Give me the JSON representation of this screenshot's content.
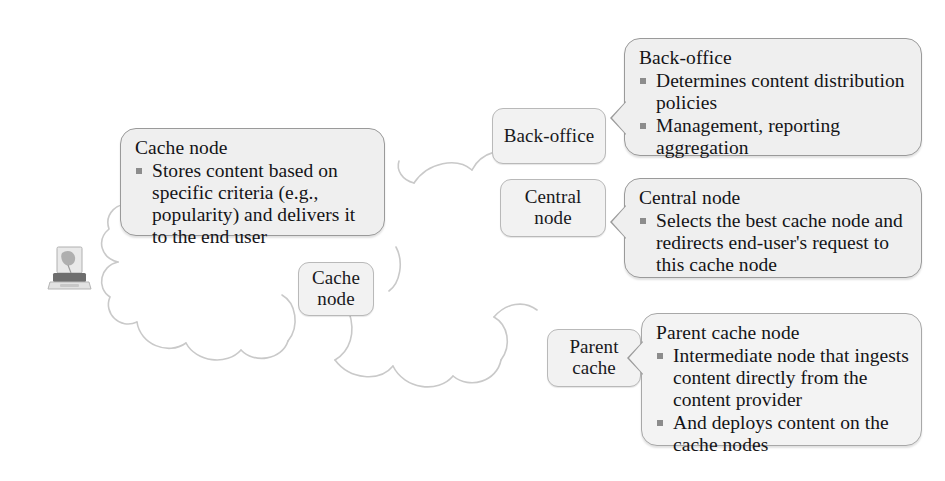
{
  "diagram": {
    "background_color": "#ffffff",
    "box_fill": "#efefef",
    "box_border": "#9a9a9a",
    "chip_fill": "#f2f2f2",
    "bullet_color": "#8c8c8c",
    "cloud_stroke": "#c9c9c9"
  },
  "clipart": {
    "laptop_label": "end-user-laptop"
  },
  "chips": [
    {
      "id": "cache-node",
      "label_line1": "Cache",
      "label_line2": "node"
    },
    {
      "id": "back-office",
      "label_line1": "Back-office",
      "label_line2": ""
    },
    {
      "id": "central-node",
      "label_line1": "Central",
      "label_line2": "node"
    },
    {
      "id": "parent-cache",
      "label_line1": "Parent",
      "label_line2": "cache"
    }
  ],
  "callouts": [
    {
      "id": "cache-node-callout",
      "title": "Cache node",
      "bullets": [
        "Stores content based on specific criteria (e.g., popularity) and delivers it to the end user"
      ]
    },
    {
      "id": "back-office-callout",
      "title": "Back-office",
      "bullets": [
        "Determines content distribution policies",
        "Management, reporting aggregation"
      ]
    },
    {
      "id": "central-node-callout",
      "title": "Central node",
      "bullets": [
        "Selects the best cache node and redirects end-user's request to this cache node"
      ]
    },
    {
      "id": "parent-cache-callout",
      "title": "Parent cache node",
      "bullets": [
        "Intermediate node that ingests  content directly from the content provider",
        "And deploys content on the cache nodes"
      ]
    }
  ]
}
